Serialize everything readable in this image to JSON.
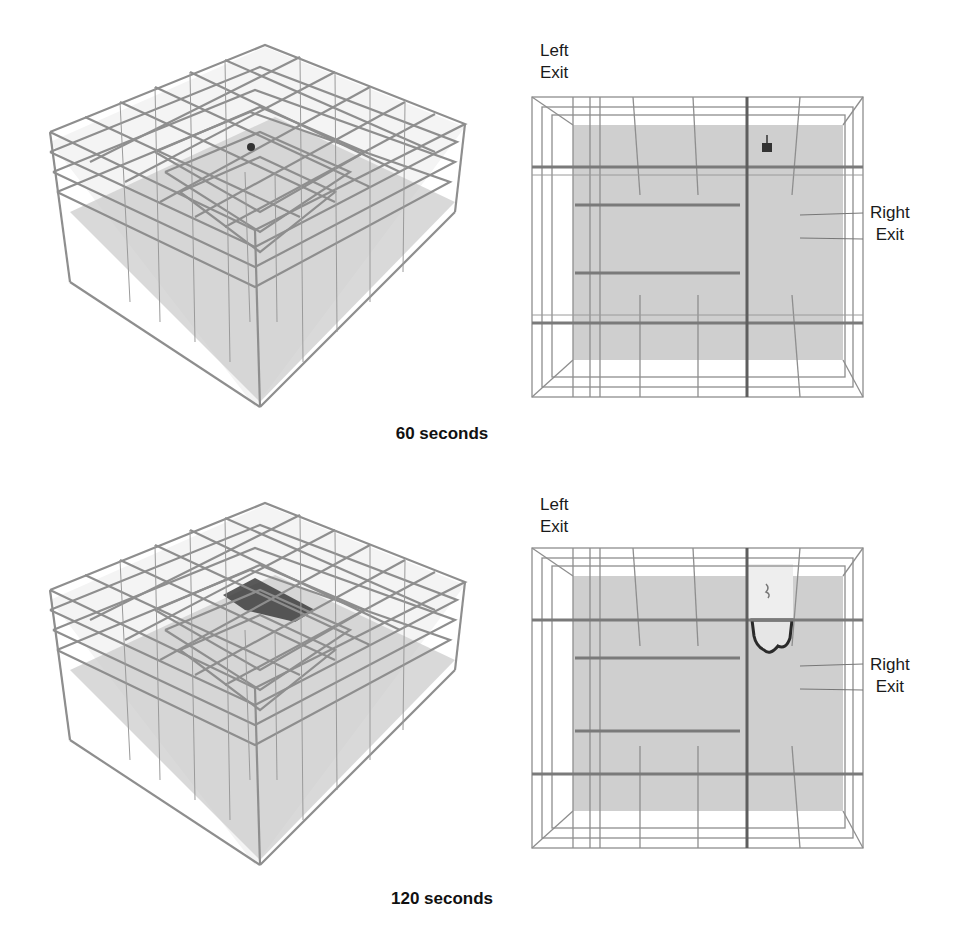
{
  "figure": {
    "panels": [
      {
        "time_caption": "60 seconds",
        "iso_view": {
          "description": "3D isometric wireframe of building with atrium; small fire source near upper floor",
          "fire_extent": "small"
        },
        "plan_view": {
          "labels": {
            "left_exit": [
              "Left",
              "Exit"
            ],
            "right_exit": [
              "Right",
              "Exit"
            ]
          },
          "fire_extent": "small"
        }
      },
      {
        "time_caption": "120 seconds",
        "iso_view": {
          "description": "3D isometric wireframe of building with atrium; smoke layer spreading across upper floor",
          "fire_extent": "large"
        },
        "plan_view": {
          "labels": {
            "left_exit": [
              "Left",
              "Exit"
            ],
            "right_exit": [
              "Right",
              "Exit"
            ]
          },
          "fire_extent": "large"
        }
      }
    ],
    "colors": {
      "wire": "#8a8a8a",
      "floor": "#c8c8c8",
      "smoke": "#3a3a3a",
      "background": "#ffffff"
    }
  }
}
